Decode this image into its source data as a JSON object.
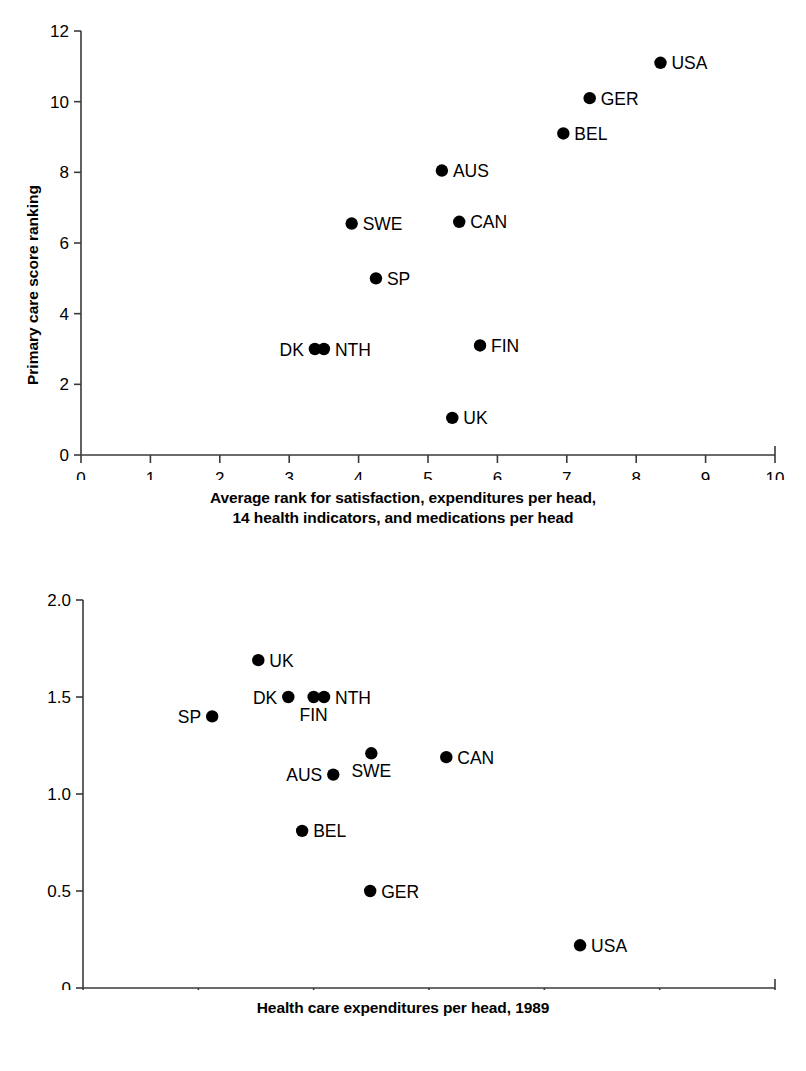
{
  "chart_data": [
    {
      "id": "top",
      "type": "scatter",
      "title": "",
      "xlabel": "Average rank for satisfaction, expenditures per head, 14 health indicators, and medications per head",
      "xlabel_lines": [
        "Average rank for satisfaction, expenditures per head,",
        "14 health indicators, and medications per head"
      ],
      "ylabel": "Primary care score ranking",
      "xlim": [
        0,
        10
      ],
      "ylim": [
        0,
        12
      ],
      "xticks": [
        0,
        1,
        2,
        3,
        4,
        5,
        6,
        7,
        8,
        9,
        10
      ],
      "xticklabels": [
        "0",
        "1",
        "2",
        "3",
        "4",
        "5",
        "6",
        "7",
        "8",
        "9",
        "10"
      ],
      "yticks": [
        0,
        2,
        4,
        6,
        8,
        10,
        12
      ],
      "yticklabels": [
        "0",
        "2",
        "4",
        "6",
        "8",
        "10",
        "12"
      ],
      "grid": false,
      "legend": "none",
      "marker": "filled-circle",
      "marker_color": "#000000",
      "points": [
        {
          "label": "USA",
          "x": 8.35,
          "y": 11.1,
          "label_side": "right"
        },
        {
          "label": "GER",
          "x": 7.33,
          "y": 10.1,
          "label_side": "right"
        },
        {
          "label": "BEL",
          "x": 6.95,
          "y": 9.1,
          "label_side": "right"
        },
        {
          "label": "AUS",
          "x": 5.2,
          "y": 8.05,
          "label_side": "right"
        },
        {
          "label": "CAN",
          "x": 5.45,
          "y": 6.6,
          "label_side": "right"
        },
        {
          "label": "SWE",
          "x": 3.9,
          "y": 6.55,
          "label_side": "right"
        },
        {
          "label": "SP",
          "x": 4.25,
          "y": 5.0,
          "label_side": "right"
        },
        {
          "label": "FIN",
          "x": 5.75,
          "y": 3.1,
          "label_side": "right"
        },
        {
          "label": "DK",
          "x": 3.37,
          "y": 3.0,
          "label_side": "left"
        },
        {
          "label": "NTH",
          "x": 3.5,
          "y": 3.0,
          "label_side": "right"
        },
        {
          "label": "UK",
          "x": 5.35,
          "y": 1.05,
          "label_side": "right"
        }
      ]
    },
    {
      "id": "bottom",
      "type": "scatter",
      "title": "",
      "xlabel": "Health care expenditures per head, 1989",
      "xlabel_lines": [
        "Health care expenditures per head, 1989"
      ],
      "ylabel": "Primary care score",
      "xlim": [
        0,
        3000
      ],
      "ylim": [
        0,
        2.0
      ],
      "xticks": [
        0,
        500,
        1000,
        1500,
        2000,
        2500,
        3000
      ],
      "xticklabels": [
        "0",
        "500",
        "1000",
        "1500",
        "2000",
        "2500",
        "3000"
      ],
      "yticks": [
        0,
        0.5,
        1.0,
        1.5,
        2.0
      ],
      "yticklabels": [
        "0",
        "0.5",
        "1.0",
        "1.5",
        "2.0"
      ],
      "grid": false,
      "legend": "none",
      "marker": "filled-circle",
      "marker_color": "#000000",
      "points": [
        {
          "label": "UK",
          "x": 760,
          "y": 1.69,
          "label_side": "right"
        },
        {
          "label": "DK",
          "x": 890,
          "y": 1.5,
          "label_side": "left"
        },
        {
          "label": "FIN",
          "x": 1000,
          "y": 1.5,
          "label_side": "below"
        },
        {
          "label": "NTH",
          "x": 1045,
          "y": 1.5,
          "label_side": "right"
        },
        {
          "label": "SP",
          "x": 560,
          "y": 1.4,
          "label_side": "left"
        },
        {
          "label": "SWE",
          "x": 1250,
          "y": 1.21,
          "label_side": "below"
        },
        {
          "label": "CAN",
          "x": 1575,
          "y": 1.19,
          "label_side": "right"
        },
        {
          "label": "AUS",
          "x": 1085,
          "y": 1.1,
          "label_side": "left"
        },
        {
          "label": "BEL",
          "x": 950,
          "y": 0.81,
          "label_side": "right"
        },
        {
          "label": "GER",
          "x": 1245,
          "y": 0.5,
          "label_side": "right"
        },
        {
          "label": "USA",
          "x": 2155,
          "y": 0.22,
          "label_side": "right"
        }
      ]
    }
  ]
}
